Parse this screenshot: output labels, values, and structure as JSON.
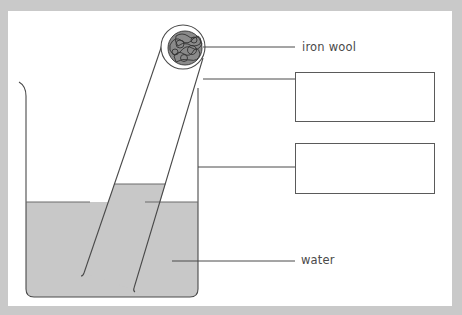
{
  "diagram": {
    "labels": {
      "iron_wool": "iron wool",
      "water": "water"
    },
    "answer_boxes": [
      {
        "id": "box-1",
        "text": ""
      },
      {
        "id": "box-2",
        "text": ""
      }
    ],
    "colors": {
      "background": "#c9c9c9",
      "panel": "#ffffff",
      "water": "#c8c8c8",
      "line": "#4a4a4a"
    }
  }
}
